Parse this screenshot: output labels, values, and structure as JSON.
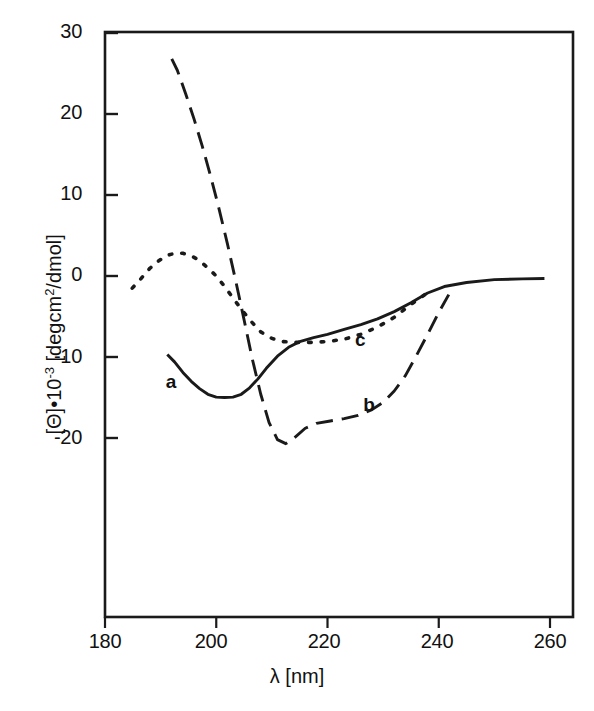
{
  "chart_data": {
    "type": "line",
    "title": "",
    "xlabel": "λ [nm]",
    "ylabel": "[Θ]•10⁻³ [degcm²/dmol]",
    "ylabel_parts": {
      "prefix": "[Θ]•10",
      "exponent": "-3",
      "suffix": " [degcm",
      "sup2": "2",
      "tail": "/dmol]"
    },
    "xlim": [
      180,
      262
    ],
    "ylim": [
      -23,
      30
    ],
    "xticks": [
      180,
      200,
      220,
      240,
      260
    ],
    "yticks": [
      30,
      20,
      10,
      0,
      -10,
      -20
    ],
    "xtick_labels": [
      "180",
      "200",
      "220",
      "240",
      "260"
    ],
    "ytick_labels": [
      "30",
      "20",
      "10",
      "0",
      "-10",
      "-20"
    ],
    "grid": false,
    "legend_position": "inline-annotations",
    "series": [
      {
        "name": "a",
        "label": "a",
        "style": "solid",
        "color": "#1a1a1a",
        "label_x": 192,
        "label_y": -13.2,
        "x": [
          191.2,
          192.5,
          194.0,
          195.5,
          197.0,
          198.5,
          200.0,
          201.5,
          203.0,
          204.5,
          206.0,
          207.5,
          209.0,
          211.0,
          213.0,
          215.0,
          217.5,
          220.0,
          223.0,
          226.0,
          229.0,
          232.0,
          235.0,
          238.0,
          241.0,
          245.0,
          250.0,
          255.0,
          259.0
        ],
        "y": [
          -9.7,
          -10.6,
          -11.9,
          -13.0,
          -13.9,
          -14.6,
          -14.95,
          -15.0,
          -14.95,
          -14.6,
          -13.8,
          -12.7,
          -11.4,
          -9.9,
          -8.8,
          -8.1,
          -7.6,
          -7.2,
          -6.6,
          -6.0,
          -5.3,
          -4.4,
          -3.3,
          -2.1,
          -1.3,
          -0.8,
          -0.45,
          -0.35,
          -0.3
        ]
      },
      {
        "name": "b",
        "label": "b",
        "style": "long-dash",
        "color": "#1a1a1a",
        "label_x": 227.5,
        "label_y": -16.1,
        "x": [
          192.0,
          193.0,
          194.5,
          196.0,
          197.5,
          199.0,
          200.5,
          202.0,
          203.5,
          205.0,
          206.5,
          208.0,
          209.5,
          211.0,
          212.5,
          214.0,
          216.0,
          218.0,
          220.5,
          223.0,
          225.5,
          228.0,
          230.0,
          232.0,
          234.0,
          236.0,
          238.0,
          240.0,
          241.8
        ],
        "y": [
          26.8,
          25.4,
          22.5,
          19.4,
          16.0,
          12.3,
          8.3,
          4.0,
          -0.6,
          -5.4,
          -10.3,
          -14.6,
          -18.1,
          -20.2,
          -20.7,
          -20.0,
          -18.8,
          -18.2,
          -17.9,
          -17.6,
          -17.2,
          -16.5,
          -15.6,
          -14.2,
          -12.3,
          -9.8,
          -7.2,
          -4.5,
          -2.3
        ]
      },
      {
        "name": "c",
        "label": "c",
        "style": "dotted",
        "color": "#1a1a1a",
        "label_x": 226.0,
        "label_y": -8.0,
        "x": [
          184.9,
          186.5,
          188.0,
          189.5,
          191.0,
          192.5,
          194.0,
          195.5,
          197.0,
          198.5,
          200.0,
          201.5,
          203.0,
          204.5,
          206.0,
          208.0,
          210.0,
          212.0,
          214.5,
          217.0,
          220.0,
          223.0,
          226.0,
          229.0,
          232.0,
          235.0,
          237.5
        ],
        "y": [
          -1.5,
          -0.3,
          0.9,
          1.8,
          2.5,
          2.8,
          2.8,
          2.5,
          1.9,
          1.0,
          0.0,
          -1.3,
          -2.7,
          -4.1,
          -5.4,
          -6.9,
          -7.7,
          -8.1,
          -8.2,
          -8.2,
          -8.1,
          -7.8,
          -7.2,
          -6.3,
          -5.1,
          -3.5,
          -2.3
        ]
      }
    ]
  },
  "axes": {
    "x_title": "λ [nm]",
    "y_title_prefix": "[Θ]•10",
    "y_title_exp": "-3",
    "y_title_rest": " [degcm",
    "y_title_sup": "2",
    "y_title_tail": "/dmol]"
  }
}
